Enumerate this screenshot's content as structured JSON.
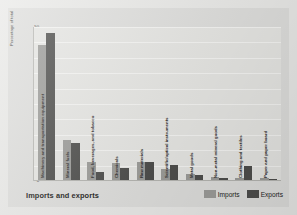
{
  "figure": {
    "title": "Imports and exports",
    "y_axis_title": "Percentage of total"
  },
  "legend": {
    "position": "bottom-right",
    "items": [
      {
        "label": "Imports",
        "color": "#9c9c99"
      },
      {
        "label": "Exports",
        "color": "#4e4e4c"
      }
    ]
  },
  "chart_data": {
    "type": "bar",
    "title": "Imports and exports",
    "xlabel": "",
    "ylabel": "Percentage of total",
    "ylim": [
      0,
      50
    ],
    "yticks": [
      0,
      5,
      10,
      15,
      20,
      25,
      30,
      35,
      40,
      45,
      50
    ],
    "grid": true,
    "categories": [
      "Machinery and transportation equipment",
      "Mineral fuels",
      "Food, beverages, and tobacco",
      "Chemicals",
      "Raw materials",
      "Scientific/optical instruments",
      "Metal goods",
      "Non-metal mineral goods",
      "Clothing and textiles",
      "Paper and paper board"
    ],
    "series": [
      {
        "name": "Imports",
        "color": "#9c9c99",
        "values": [
          44,
          13,
          6,
          5.5,
          6,
          3.5,
          2,
          1,
          0.8,
          0.6
        ]
      },
      {
        "name": "Exports",
        "color": "#4e4e4c",
        "values": [
          48,
          12,
          2.5,
          4,
          6,
          5,
          1.5,
          0.5,
          4.5,
          0.4
        ]
      }
    ]
  }
}
